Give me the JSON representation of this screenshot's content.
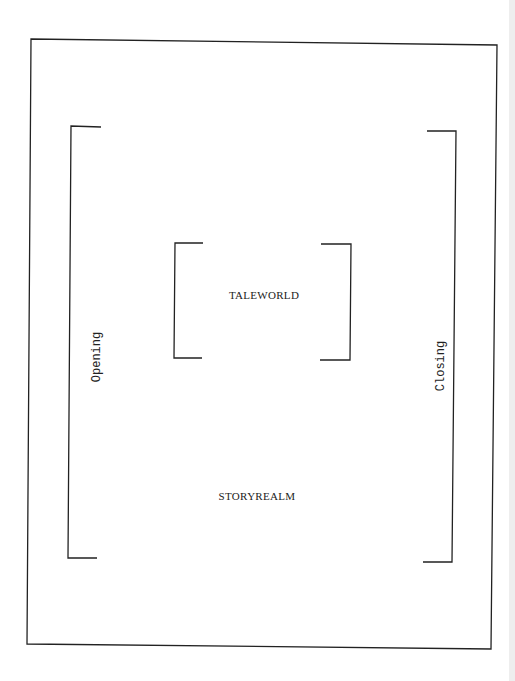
{
  "diagram": {
    "inner_label": "TALEWORLD",
    "outer_label": "STORYREALM",
    "left_label": "Opening",
    "right_label": "Closing",
    "line_color": "#222222"
  }
}
